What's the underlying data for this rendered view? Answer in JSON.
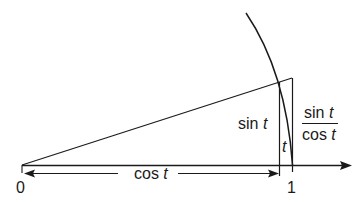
{
  "diagram": {
    "labels": {
      "origin": "0",
      "one": "1",
      "cos_word": "cos",
      "sin_word": "sin",
      "t": "t",
      "angle_t": "t",
      "frac_num_word": "sin",
      "frac_den_word": "cos"
    },
    "colors": {
      "stroke": "#1a1a1a",
      "background": "#ffffff"
    }
  }
}
